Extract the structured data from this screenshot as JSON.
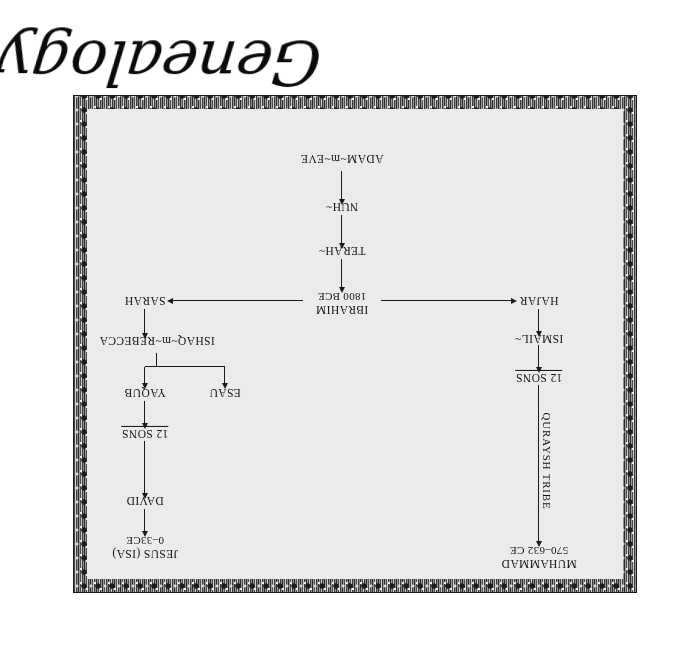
{
  "caption": {
    "text": "Genealogy"
  },
  "diagram": {
    "title": "Genealogy",
    "type": "family-tree",
    "orientation": "rotated-180",
    "nodes": [
      {
        "id": "adam_eve",
        "label": "ADAM~m~EVE",
        "sub": ""
      },
      {
        "id": "nuh",
        "label": "NUH~",
        "sub": ""
      },
      {
        "id": "terah",
        "label": "TERAH~",
        "sub": ""
      },
      {
        "id": "ibrahim",
        "label": "IBRAHIM",
        "sub": "1800 BCE"
      },
      {
        "id": "hajar",
        "label": "HAJAR",
        "sub": ""
      },
      {
        "id": "sarah",
        "label": "SARAH",
        "sub": ""
      },
      {
        "id": "ismail",
        "label": "ISMAIL~",
        "sub": ""
      },
      {
        "id": "ishaq",
        "label": "ISHAQ~m~REBECCA",
        "sub": ""
      },
      {
        "id": "sons_ismail",
        "label": "12 SONS",
        "sub": ""
      },
      {
        "id": "esau",
        "label": "ESAU",
        "sub": ""
      },
      {
        "id": "yaqub",
        "label": "YAQUB",
        "sub": ""
      },
      {
        "id": "sons_yaqub",
        "label": "12 SONS",
        "sub": ""
      },
      {
        "id": "david",
        "label": "DAVID",
        "sub": ""
      },
      {
        "id": "jesus",
        "label": "JESUS (ISA)",
        "sub": "0–33CE"
      },
      {
        "id": "quraysh",
        "label": "QURAYSH TRIBE",
        "sub": ""
      },
      {
        "id": "muhammad",
        "label": "MUHAMMAD",
        "sub": "570–632 CE"
      }
    ],
    "edges": [
      {
        "from": "adam_eve",
        "to": "nuh"
      },
      {
        "from": "nuh",
        "to": "terah"
      },
      {
        "from": "terah",
        "to": "ibrahim"
      },
      {
        "from": "ibrahim",
        "to": "hajar"
      },
      {
        "from": "ibrahim",
        "to": "sarah"
      },
      {
        "from": "hajar",
        "to": "ismail"
      },
      {
        "from": "sarah",
        "to": "ishaq"
      },
      {
        "from": "ismail",
        "to": "sons_ismail"
      },
      {
        "from": "ishaq",
        "to": "esau"
      },
      {
        "from": "ishaq",
        "to": "yaqub"
      },
      {
        "from": "yaqub",
        "to": "sons_yaqub"
      },
      {
        "from": "sons_yaqub",
        "to": "david"
      },
      {
        "from": "david",
        "to": "jesus"
      },
      {
        "from": "sons_ismail",
        "to": "muhammad",
        "label": "QURAYSH TRIBE"
      }
    ]
  },
  "colors": {
    "paper": "#ebebeb",
    "ink": "#111111",
    "frame_dark": "#2b2b2b",
    "page_background": "#ffffff"
  }
}
